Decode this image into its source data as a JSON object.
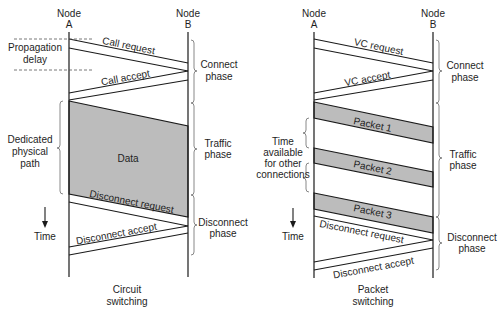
{
  "circuit": {
    "node_a": [
      "Node",
      "A"
    ],
    "node_b": [
      "Node",
      "B"
    ],
    "request": "Call request",
    "accept": "Call accept",
    "data": "Data",
    "disconnect_request": "Disconnect request",
    "disconnect_accept": "Disconnect accept",
    "propagation_delay": [
      "Propagation",
      "delay"
    ],
    "dedicated_path": [
      "Dedicated",
      "physical",
      "path"
    ],
    "time": "Time",
    "phases": {
      "connect": [
        "Connect",
        "phase"
      ],
      "traffic": [
        "Traffic",
        "phase"
      ],
      "disconnect": [
        "Disconnect",
        "phase"
      ]
    },
    "caption": [
      "Circuit",
      "switching"
    ]
  },
  "packet": {
    "node_a": [
      "Node",
      "A"
    ],
    "node_b": [
      "Node",
      "B"
    ],
    "request": "VC request",
    "accept": "VC accept",
    "packets": [
      "Packet 1",
      "Packet 2",
      "Packet 3"
    ],
    "disconnect_request": "Disconnect request",
    "disconnect_accept": "Disconnect accept",
    "time_available": [
      "Time",
      "available",
      "for other",
      "connections"
    ],
    "time": "Time",
    "phases": {
      "connect": [
        "Connect",
        "phase"
      ],
      "traffic": [
        "Traffic",
        "phase"
      ],
      "disconnect": [
        "Disconnect",
        "phase"
      ]
    },
    "caption": [
      "Packet",
      "switching"
    ]
  },
  "colors": {
    "line": "#1a1a1a",
    "shaded": "#bcbcbc",
    "background": "#ffffff"
  }
}
